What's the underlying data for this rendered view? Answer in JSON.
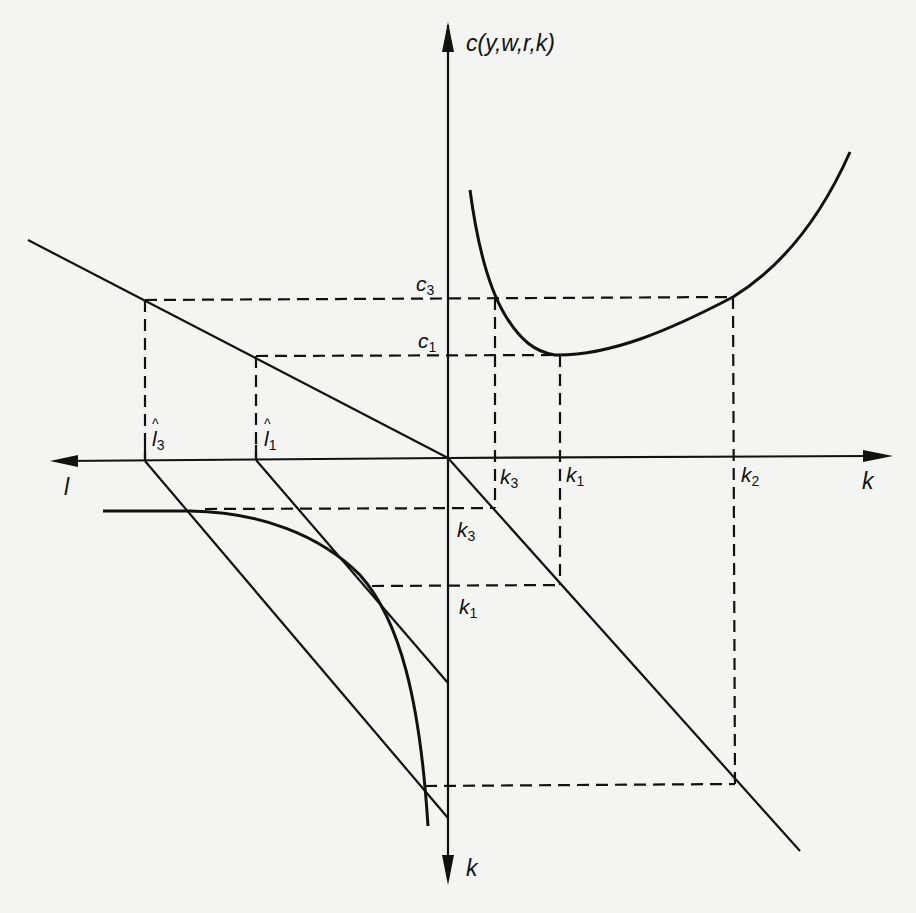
{
  "figure": {
    "type": "four-quadrant cost diagram",
    "colors": {
      "background": "#f4f4f2",
      "ink": "#111111"
    },
    "axes": {
      "up_label": "c(y,w,r,k)",
      "right_label": "k",
      "left_label": "l",
      "down_label": "k"
    },
    "levels": {
      "c3": {
        "name": "c",
        "sub": "3"
      },
      "c1": {
        "name": "c",
        "sub": "1"
      }
    },
    "horizontal_ticks": {
      "k3": {
        "name": "k",
        "sub": "3"
      },
      "k1": {
        "name": "k",
        "sub": "1"
      },
      "k2": {
        "name": "k",
        "sub": "2"
      },
      "l3": {
        "name": "l",
        "sub": "3",
        "hat": true
      },
      "l1": {
        "name": "l",
        "sub": "1",
        "hat": true
      }
    },
    "vertical_ticks_lower": {
      "k3": {
        "name": "k",
        "sub": "3"
      },
      "k1": {
        "name": "k",
        "sub": "1"
      }
    },
    "curves": [
      "short-run cost curve c(y,w,r,k) (U-shaped, upper-right quadrant)",
      "cost/labor line (upper-left quadrant)",
      "45-degree line k=k (lower-right quadrant)",
      "isoquant (lower-left quadrant)",
      "isocost lines tangent at l1 and l3 (lower-left quadrant)"
    ]
  }
}
